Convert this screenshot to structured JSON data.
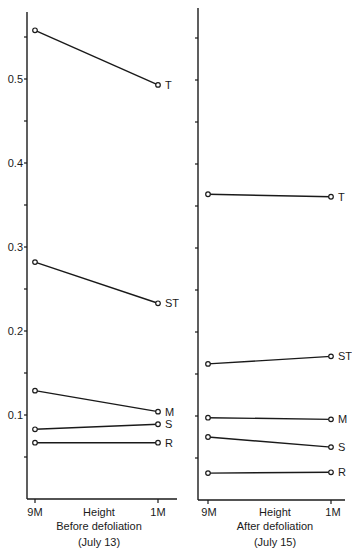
{
  "chart_data": [
    {
      "type": "line",
      "title": "Before defoliation",
      "subtitle": "(July 13)",
      "xlabel": "Height",
      "ylabel": "",
      "categories": [
        "9M",
        "1M"
      ],
      "ylim": [
        0,
        0.58
      ],
      "yticks": [
        0.1,
        0.2,
        0.3,
        0.4,
        0.5
      ],
      "ytick_labels": [
        "0.1",
        "0.2",
        "0.3",
        "0.4",
        "0.5"
      ],
      "minor_tick_step": 0.05,
      "grid": false,
      "legend": "inline labels at right end of each line",
      "series": [
        {
          "name": "T",
          "values": [
            0.558,
            0.493
          ]
        },
        {
          "name": "ST",
          "values": [
            0.282,
            0.233
          ]
        },
        {
          "name": "M",
          "values": [
            0.129,
            0.104
          ]
        },
        {
          "name": "S",
          "values": [
            0.083,
            0.089
          ]
        },
        {
          "name": "R",
          "values": [
            0.067,
            0.067
          ]
        }
      ]
    },
    {
      "type": "line",
      "title": "After defoliation",
      "subtitle": "(July 15)",
      "xlabel": "Height",
      "ylabel": "",
      "categories": [
        "9M",
        "1M"
      ],
      "ylim": [
        0,
        0.58
      ],
      "yticks": [],
      "ytick_labels": [],
      "minor_tick_step": 0.05,
      "grid": false,
      "legend": "inline labels at right end of each line",
      "series": [
        {
          "name": "T",
          "values": [
            0.364,
            0.361
          ]
        },
        {
          "name": "ST",
          "values": [
            0.162,
            0.171
          ]
        },
        {
          "name": "M",
          "values": [
            0.098,
            0.096
          ]
        },
        {
          "name": "S",
          "values": [
            0.075,
            0.063
          ]
        },
        {
          "name": "R",
          "values": [
            0.032,
            0.033
          ]
        }
      ]
    }
  ],
  "panels": [
    {
      "xlabel": "Height",
      "x_left": "9M",
      "x_right": "1M",
      "caption": "Before defoliation",
      "date": "(July 13)"
    },
    {
      "xlabel": "Height",
      "x_left": "9M",
      "x_right": "1M",
      "caption": "After defoliation",
      "date": "(July 15)"
    }
  ],
  "colors": {
    "ink": "#1a1a1a",
    "background": "#ffffff"
  }
}
